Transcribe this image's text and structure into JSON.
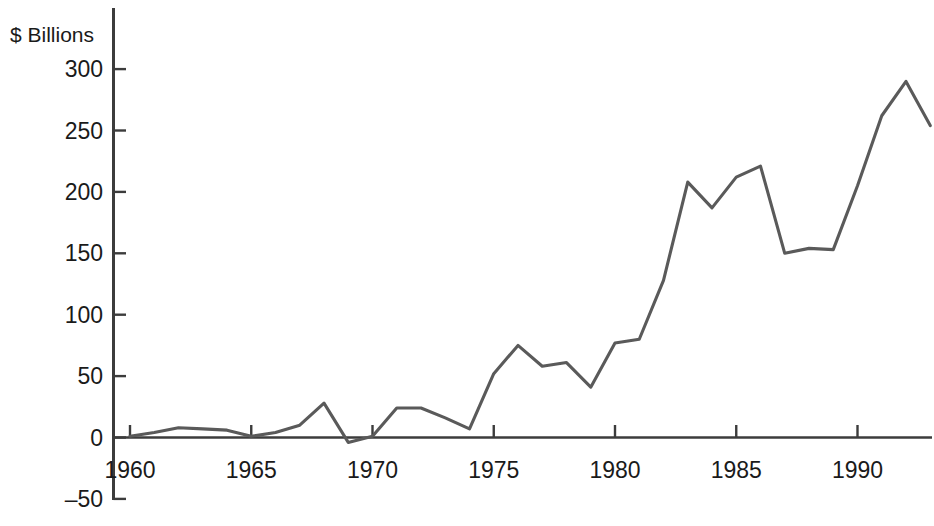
{
  "chart_data": {
    "type": "line",
    "title": "",
    "subtitle": "",
    "xlabel": "",
    "ylabel": "$ Billions",
    "ylabel_position": "top-left",
    "grid": false,
    "legend": false,
    "legend_position": "none",
    "series_color": "#5a5a5a",
    "axis_color": "#3c3c3c",
    "xlim": [
      1959.4,
      1993.3
    ],
    "ylim": [
      -50,
      310
    ],
    "yticks": [
      -50,
      0,
      50,
      100,
      150,
      200,
      250,
      300
    ],
    "ytick_labels": [
      "–50",
      "0",
      "50",
      "100",
      "150",
      "200",
      "250",
      "300"
    ],
    "xticks": [
      1960,
      1965,
      1970,
      1975,
      1980,
      1985,
      1990
    ],
    "xtick_labels": [
      "1960",
      "1965",
      "1970",
      "1975",
      "1980",
      "1985",
      "1990"
    ],
    "x": [
      1960,
      1961,
      1962,
      1963,
      1964,
      1965,
      1966,
      1967,
      1968,
      1969,
      1970,
      1971,
      1972,
      1973,
      1974,
      1975,
      1976,
      1977,
      1978,
      1979,
      1980,
      1981,
      1982,
      1983,
      1984,
      1985,
      1986,
      1987,
      1988,
      1989,
      1990,
      1991,
      1992,
      1993
    ],
    "series": [
      {
        "name": "",
        "values": [
          1,
          4,
          8,
          7,
          6,
          1,
          4,
          10,
          28,
          -4,
          1,
          24,
          24,
          16,
          7,
          52,
          75,
          58,
          61,
          41,
          77,
          80,
          128,
          208,
          187,
          212,
          221,
          150,
          154,
          153,
          205,
          262,
          290,
          254
        ]
      }
    ]
  }
}
